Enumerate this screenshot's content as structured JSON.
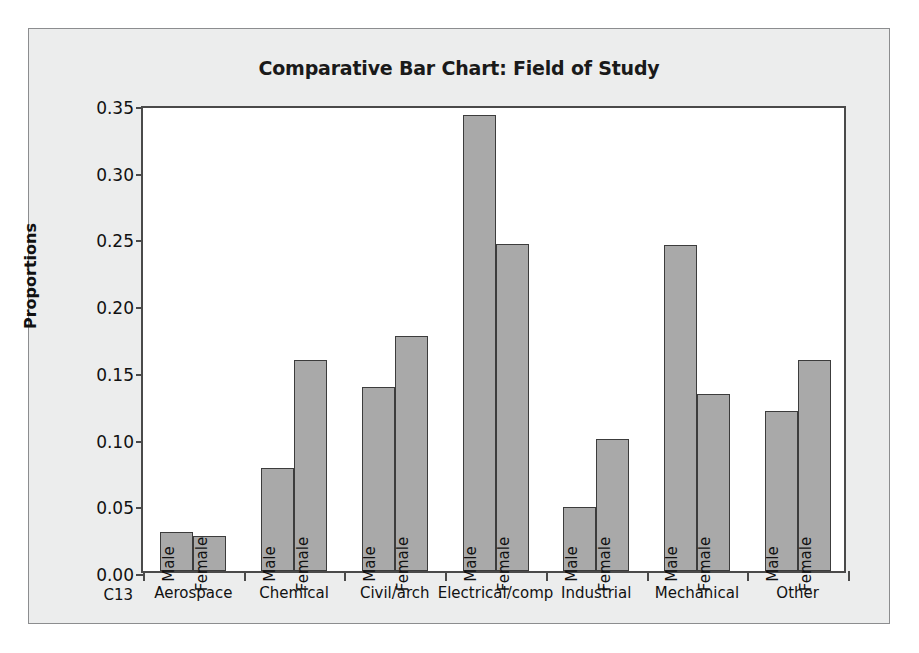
{
  "chart_data": {
    "type": "bar",
    "title": "Comparative Bar Chart: Field of Study",
    "xlabel": "C13",
    "ylabel": "Proportions",
    "categories": [
      "Aerospace",
      "Chemical",
      "Civil/arch",
      "Electrical/comp",
      "Industrial",
      "Mechanical",
      "Other"
    ],
    "series": [
      {
        "name": "Male",
        "values": [
          0.029,
          0.077,
          0.138,
          0.342,
          0.048,
          0.244,
          0.12
        ]
      },
      {
        "name": "Female",
        "values": [
          0.026,
          0.158,
          0.176,
          0.245,
          0.099,
          0.133,
          0.158
        ]
      }
    ],
    "ylim": [
      0.0,
      0.35
    ],
    "ytick_labels": [
      "0.00",
      "0.05",
      "0.10",
      "0.15",
      "0.20",
      "0.25",
      "0.30",
      "0.35"
    ],
    "ytick_values": [
      0.0,
      0.05,
      0.1,
      0.15,
      0.2,
      0.25,
      0.3,
      0.35
    ],
    "grid": false,
    "legend": "none",
    "bar_labels_rotated": true,
    "colors": {
      "bar_fill": "#a9a9a9",
      "bar_border": "#3c3c3c",
      "panel_background": "#eceded",
      "plot_background": "#ffffff",
      "axis": "#4a4a4a",
      "text": "#111111"
    }
  }
}
